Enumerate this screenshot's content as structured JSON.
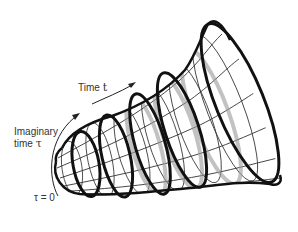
{
  "diagram": {
    "type": "no-boundary-universe-trumpet",
    "labels": {
      "time_word": "Time",
      "time_symbol": "t",
      "imaginary_line1": "Imaginary",
      "imaginary_line2_word": "time",
      "imaginary_symbol": "τ",
      "tau_zero": "τ = 0"
    },
    "colors": {
      "stroke": "#111111",
      "grid": "#333333",
      "shadow": "#9a9a9a",
      "text": "#333333",
      "background": "#ffffff"
    }
  }
}
